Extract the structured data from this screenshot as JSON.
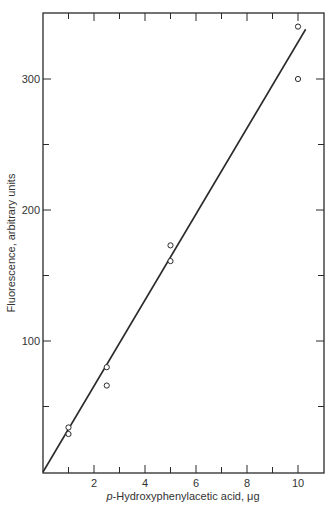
{
  "chart_data": {
    "type": "scatter",
    "title": "",
    "xlabel_italic_prefix": "p",
    "xlabel_rest": "-Hydroxyphenylacetic acid, μg",
    "xlabel": "p-Hydroxyphenylacetic acid, μg",
    "ylabel": "Fluorescence, arbitrary units",
    "xlim": [
      0,
      11
    ],
    "ylim": [
      0,
      350
    ],
    "x_ticks_major": [
      2,
      4,
      6,
      8,
      10
    ],
    "x_tick_labels": [
      "2",
      "4",
      "6",
      "8",
      "10"
    ],
    "x_ticks_minor": [
      1,
      3,
      5,
      7,
      9
    ],
    "y_ticks_major": [
      100,
      200,
      300
    ],
    "y_tick_labels": [
      "100",
      "200",
      "300"
    ],
    "y_ticks_minor": [
      50,
      150,
      250
    ],
    "grid": false,
    "legend": null,
    "series": [
      {
        "name": "measured",
        "marker": "open-circle",
        "points": [
          {
            "x": 1.0,
            "y": 34
          },
          {
            "x": 1.0,
            "y": 29
          },
          {
            "x": 2.5,
            "y": 80
          },
          {
            "x": 2.5,
            "y": 66
          },
          {
            "x": 5.0,
            "y": 173
          },
          {
            "x": 5.0,
            "y": 161
          },
          {
            "x": 10.0,
            "y": 340
          },
          {
            "x": 10.0,
            "y": 300
          }
        ]
      },
      {
        "name": "fit-line",
        "style": "line",
        "points": [
          {
            "x": 0,
            "y": 0
          },
          {
            "x": 10.3,
            "y": 338
          }
        ]
      }
    ]
  },
  "colors": {
    "ink": "#2a2a2a",
    "background": "#ffffff"
  }
}
